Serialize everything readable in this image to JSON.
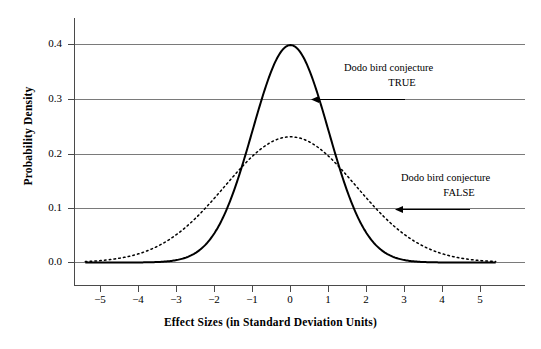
{
  "chart_data": {
    "type": "line",
    "title": "",
    "xlabel": "Effect Sizes (in Standard Deviation Units)",
    "ylabel": "Probability Density",
    "xlim": [
      -5.4,
      5.4
    ],
    "ylim": [
      0.0,
      0.44
    ],
    "grid": true,
    "legend_position": "none",
    "x_ticks": [
      "−5",
      "−4",
      "−3",
      "−2",
      "−1",
      "0",
      "1",
      "2",
      "3",
      "4",
      "5"
    ],
    "x_tick_values": [
      -5,
      -4,
      -3,
      -2,
      -1,
      0,
      1,
      2,
      3,
      4,
      5
    ],
    "y_ticks": [
      "0.0",
      "0.1",
      "0.2",
      "0.3",
      "0.4"
    ],
    "y_tick_values": [
      0.0,
      0.1,
      0.2,
      0.3,
      0.4
    ],
    "series": [
      {
        "name": "Dodo bird conjecture TRUE",
        "style": "solid",
        "color": "#000000",
        "distribution": "normal",
        "mean": 0,
        "sd": 1.0,
        "peak": 0.399,
        "x": [
          -5,
          -4.5,
          -4,
          -3.5,
          -3,
          -2.5,
          -2,
          -1.5,
          -1,
          -0.5,
          0,
          0.5,
          1,
          1.5,
          2,
          2.5,
          3,
          3.5,
          4,
          4.5,
          5
        ],
        "values": [
          0.0,
          0.0,
          0.0,
          0.001,
          0.004,
          0.018,
          0.054,
          0.13,
          0.242,
          0.352,
          0.399,
          0.352,
          0.242,
          0.13,
          0.054,
          0.018,
          0.004,
          0.001,
          0.0,
          0.0,
          0.0
        ]
      },
      {
        "name": "Dodo bird conjecture FALSE",
        "style": "dotted",
        "color": "#000000",
        "distribution": "normal",
        "mean": 0,
        "sd": 1.73,
        "peak": 0.231,
        "x": [
          -5,
          -4.5,
          -4,
          -3.5,
          -3,
          -2.5,
          -2,
          -1.5,
          -1,
          -0.5,
          0,
          0.5,
          1,
          1.5,
          2,
          2.5,
          3,
          3.5,
          4,
          4.5,
          5
        ],
        "values": [
          0.005,
          0.013,
          0.029,
          0.056,
          0.095,
          0.14,
          0.181,
          0.209,
          0.223,
          0.23,
          0.231,
          0.23,
          0.223,
          0.209,
          0.181,
          0.14,
          0.095,
          0.056,
          0.029,
          0.013,
          0.005
        ]
      }
    ],
    "annotations": [
      {
        "id": "true-annotation",
        "line1": "Dodo bird conjecture",
        "line2": "TRUE",
        "arrow": "left",
        "points_to_x": 0.6,
        "points_to_y": 0.3
      },
      {
        "id": "false-annotation",
        "line1": "Dodo bird conjecture",
        "line2": "FALSE",
        "arrow": "left",
        "points_to_x": 2.75,
        "points_to_y": 0.1
      }
    ]
  },
  "axes": {
    "x_title": "Effect Sizes (in Standard Deviation Units)",
    "y_title": "Probability Density"
  },
  "y_labels": {
    "t0": "0.0",
    "t1": "0.1",
    "t2": "0.2",
    "t3": "0.3",
    "t4": "0.4"
  },
  "x_labels": {
    "m5": "−5",
    "m4": "−4",
    "m3": "−3",
    "m2": "−2",
    "m1": "−1",
    "z0": "0",
    "p1": "1",
    "p2": "2",
    "p3": "3",
    "p4": "4",
    "p5": "5"
  },
  "annotations": {
    "true_line1": "Dodo bird conjecture",
    "true_line2": "TRUE",
    "false_line1": "Dodo bird conjecture",
    "false_line2": "FALSE"
  },
  "colors": {
    "curve": "#000000",
    "grid": "#6b6b6b",
    "axis": "#4a4a4a",
    "background": "#ffffff"
  }
}
